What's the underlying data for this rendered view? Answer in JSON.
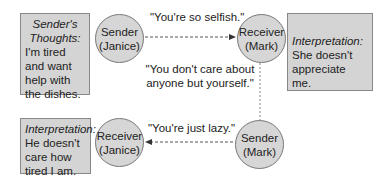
{
  "boxes": {
    "sender_thoughts": {
      "title": "Sender's",
      "title2": "Thoughts:",
      "lines": [
        "I'm tired",
        "and want",
        "help with",
        "the dishes."
      ]
    },
    "interp_mark": {
      "title": "Interpretation:",
      "lines": [
        "She doesn't",
        "appreciate me."
      ]
    },
    "interp_janice": {
      "title": "Interpretation:",
      "lines": [
        "He doesn't",
        "care how",
        "tired I am."
      ]
    }
  },
  "nodes": {
    "sender_janice": {
      "role": "Sender",
      "name": "(Janice)"
    },
    "receiver_mark": {
      "role": "Receiver",
      "name": "(Mark)"
    },
    "receiver_janice": {
      "role": "Receiver",
      "name": "(Janice)"
    },
    "sender_mark": {
      "role": "Sender",
      "name": "(Mark)"
    }
  },
  "messages": {
    "m1": "\"You're so selfish.\"",
    "m2_line1": "\"You don't care about",
    "m2_line2": "anyone but yourself.\"",
    "m3": "\"You're just lazy.\""
  },
  "colors": {
    "fill": "#d4d4d4",
    "stroke": "#777777",
    "arrow": "#444444"
  }
}
